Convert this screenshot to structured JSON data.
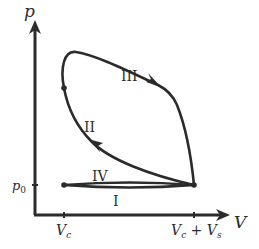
{
  "diagram": {
    "type": "p-V indicator diagram",
    "axes": {
      "y_label": "p",
      "x_label": "V",
      "y_tick_label_base": "p",
      "y_tick_label_sub": "0",
      "x_ticks": [
        {
          "main": "V",
          "sub": "c"
        },
        {
          "main": "V",
          "sub": "c",
          "plus": " + ",
          "main2": "V",
          "sub2": "s"
        }
      ]
    },
    "regions": {
      "I": "I",
      "II": "II",
      "III": "III",
      "IV": "IV"
    },
    "colors": {
      "stroke": "#2b2b2b",
      "background": "#ffffff"
    }
  }
}
